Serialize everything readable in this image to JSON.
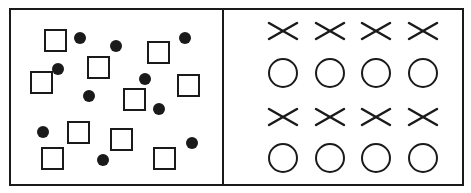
{
  "figure": {
    "width": 471,
    "height": 193,
    "stroke_color": "#1a1a1a",
    "fill_color": "#1a1a1a",
    "background": "#ffffff",
    "frame": {
      "x": 10,
      "y": 9,
      "w": 453,
      "h": 176,
      "divider_x": 223
    }
  },
  "left_panel": {
    "description": "scattered squares and dots",
    "square_size": 21,
    "squares": [
      {
        "x": 45,
        "y": 30
      },
      {
        "x": 148,
        "y": 42
      },
      {
        "x": 88,
        "y": 57
      },
      {
        "x": 31,
        "y": 72
      },
      {
        "x": 178,
        "y": 75
      },
      {
        "x": 124,
        "y": 89
      },
      {
        "x": 68,
        "y": 122
      },
      {
        "x": 111,
        "y": 129
      },
      {
        "x": 42,
        "y": 148
      },
      {
        "x": 154,
        "y": 148
      }
    ],
    "dot_radius": 6,
    "dots": [
      {
        "cx": 80,
        "cy": 38
      },
      {
        "cx": 116,
        "cy": 46
      },
      {
        "cx": 185,
        "cy": 38
      },
      {
        "cx": 58,
        "cy": 69
      },
      {
        "cx": 145,
        "cy": 79
      },
      {
        "cx": 89,
        "cy": 96
      },
      {
        "cx": 159,
        "cy": 109
      },
      {
        "cx": 43,
        "cy": 132
      },
      {
        "cx": 192,
        "cy": 143
      },
      {
        "cx": 103,
        "cy": 160
      }
    ]
  },
  "right_panel": {
    "description": "ordered rows of crosses and circles",
    "columns_x": [
      283,
      330,
      376,
      423
    ],
    "rows": [
      {
        "type": "cross",
        "y": 31
      },
      {
        "type": "circle",
        "y": 73
      },
      {
        "type": "cross",
        "y": 117
      },
      {
        "type": "circle",
        "y": 158
      }
    ],
    "cross_half_w": 14,
    "cross_half_h": 8,
    "circle_radius": 14
  }
}
